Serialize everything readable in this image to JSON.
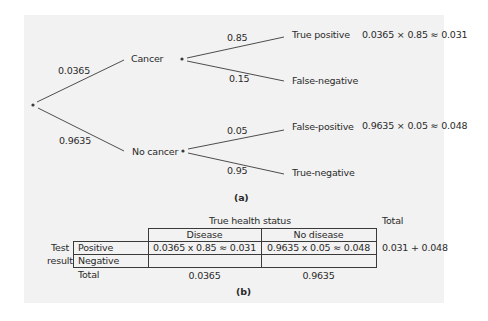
{
  "figure_a": {
    "root": {
      "label": ""
    },
    "branches": [
      {
        "prob": "0.0365",
        "node": "Cancer",
        "children": [
          {
            "prob": "0.85",
            "leaf": "True positive",
            "calc": "0.0365 × 0.85 ≈ 0.031"
          },
          {
            "prob": "0.15",
            "leaf": "False-negative",
            "calc": ""
          }
        ]
      },
      {
        "prob": "0.9635",
        "node": "No cancer",
        "children": [
          {
            "prob": "0.05",
            "leaf": "False-positive",
            "calc": "0.9635 × 0.05 ≈ 0.048"
          },
          {
            "prob": "0.95",
            "leaf": "True-negative",
            "calc": ""
          }
        ]
      }
    ],
    "caption": "(a)"
  },
  "figure_b": {
    "header_group": "True health status",
    "total_header": "Total",
    "columns": [
      "Disease",
      "No disease"
    ],
    "row_group_label": [
      "Test",
      "result"
    ],
    "rows": [
      {
        "label": "Positive",
        "cells": [
          "0.0365 x 0.85 ≈ 0.031",
          "0.9635 x 0.05 ≈ 0.048"
        ],
        "total": "0.031 + 0.048"
      },
      {
        "label": "Negative",
        "cells": [
          "",
          ""
        ],
        "total": ""
      }
    ],
    "totals_row": {
      "label": "Total",
      "cells": [
        "0.0365",
        "0.9635"
      ]
    },
    "caption": "(b)"
  },
  "colors": {
    "panel": "#f2f2f2",
    "lines": "#3a3a3a",
    "text": "#2a2a2a"
  }
}
